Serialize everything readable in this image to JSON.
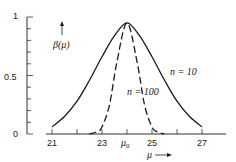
{
  "chart_data": {
    "type": "line",
    "title": "",
    "xlabel": "μ",
    "ylabel": "β(μ)",
    "xlim": [
      20.8,
      28.0
    ],
    "ylim": [
      0,
      1
    ],
    "grid": false,
    "legend": "inline annotations",
    "note": "All numeric values below are read visually off the screenshot; the underlying function is not shown in the image.",
    "x_ticks": [
      {
        "value": 21,
        "label": "21"
      },
      {
        "value": 22,
        "label": ""
      },
      {
        "value": 23,
        "label": "23"
      },
      {
        "value": 24,
        "label": "μ0"
      },
      {
        "value": 25,
        "label": "25"
      },
      {
        "value": 26,
        "label": ""
      },
      {
        "value": 27,
        "label": "27"
      }
    ],
    "y_ticks": [
      {
        "value": 0,
        "label": "0"
      },
      {
        "value": 0.1,
        "label": ""
      },
      {
        "value": 0.2,
        "label": ""
      },
      {
        "value": 0.3,
        "label": ""
      },
      {
        "value": 0.4,
        "label": ""
      },
      {
        "value": 0.5,
        "label": "0.5"
      },
      {
        "value": 0.6,
        "label": ""
      },
      {
        "value": 0.7,
        "label": ""
      },
      {
        "value": 0.8,
        "label": ""
      },
      {
        "value": 0.9,
        "label": ""
      },
      {
        "value": 1.0,
        "label": "1"
      }
    ],
    "series": [
      {
        "name": "n = 10",
        "style": "solid",
        "x": [
          21.0,
          21.5,
          22.0,
          22.5,
          23.0,
          23.5,
          24.0,
          24.5,
          25.0,
          25.5,
          26.0,
          26.5,
          27.0
        ],
        "y": [
          0.06,
          0.15,
          0.28,
          0.46,
          0.66,
          0.84,
          0.95,
          0.84,
          0.66,
          0.46,
          0.28,
          0.15,
          0.06
        ]
      },
      {
        "name": "n = 100",
        "style": "dashed",
        "x": [
          22.5,
          22.8,
          23.0,
          23.3,
          23.6,
          24.0,
          24.4,
          24.7,
          25.0,
          25.2,
          25.5
        ],
        "y": [
          0.0,
          0.02,
          0.06,
          0.25,
          0.62,
          0.95,
          0.62,
          0.25,
          0.06,
          0.02,
          0.0
        ]
      }
    ],
    "annotations": [
      {
        "text": "n = 10",
        "x": 26.2,
        "y": 0.5
      },
      {
        "text": "n = 100",
        "x": 24.7,
        "y": 0.33
      },
      {
        "text": "β(μ)",
        "x": 22.1,
        "y": 0.83
      },
      {
        "text": "μ →",
        "x": 25.3,
        "y": -0.17
      }
    ],
    "peak_value": 0.95,
    "significance_level": 0.05
  },
  "labels": {
    "y_axis_label": "β(μ)",
    "x_axis_label": "μ",
    "series_n10": "n = 10",
    "series_n100": "n = 100",
    "y0": "0",
    "y05": "0.5",
    "y1": "1",
    "x21": "21",
    "x23": "23",
    "x_mu0": "μ",
    "x_mu0_sub": "0",
    "x25": "25",
    "x27": "27"
  },
  "colors": {
    "ink": "#1a1a1a",
    "background": "#ffffff"
  }
}
